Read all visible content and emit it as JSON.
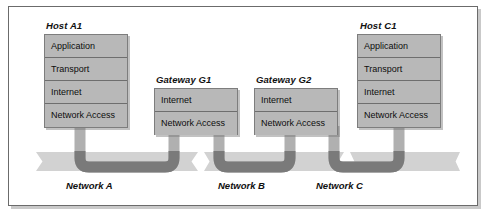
{
  "figure": {
    "colors": {
      "box_fill": "#b8b8b8",
      "box_border": "#7d7d7d",
      "band_fill": "#d2d2d2",
      "cable_light": "#b0b0b0",
      "cable_dark": "#7a7a7a",
      "frame_border": "#6b6b6b",
      "text": "#101010",
      "background": "#ffffff"
    }
  },
  "nodes": [
    {
      "id": "host-a1",
      "title": "Host A1",
      "type": "host",
      "layers": [
        {
          "label": "Application"
        },
        {
          "label": "Transport"
        },
        {
          "label": "Internet"
        },
        {
          "label": "Network Access"
        }
      ]
    },
    {
      "id": "gateway-g1",
      "title": "Gateway G1",
      "type": "gateway",
      "layers": [
        {
          "label": "Internet"
        },
        {
          "label": "Network Access"
        }
      ]
    },
    {
      "id": "gateway-g2",
      "title": "Gateway G2",
      "type": "gateway",
      "layers": [
        {
          "label": "Internet"
        },
        {
          "label": "Network Access"
        }
      ]
    },
    {
      "id": "host-c1",
      "title": "Host C1",
      "type": "host",
      "layers": [
        {
          "label": "Application"
        },
        {
          "label": "Transport"
        },
        {
          "label": "Internet"
        },
        {
          "label": "Network Access"
        }
      ]
    }
  ],
  "networks": [
    {
      "id": "network-a",
      "label": "Network A"
    },
    {
      "id": "network-b",
      "label": "Network B"
    },
    {
      "id": "network-c",
      "label": "Network C"
    }
  ]
}
